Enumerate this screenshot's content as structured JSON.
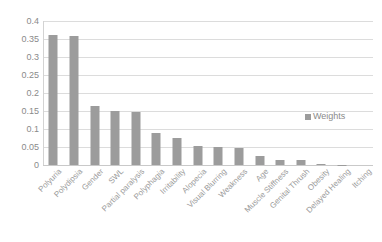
{
  "chart_data": {
    "type": "bar",
    "title": "",
    "subtitle": "",
    "xlabel": "",
    "ylabel": "",
    "ylim": [
      0,
      0.4
    ],
    "ytick_values": [
      0,
      0.05,
      0.1,
      0.15,
      0.2,
      0.25,
      0.3,
      0.35,
      0.4
    ],
    "ytick_labels": [
      "0",
      "0.05",
      "0.1",
      "0.15",
      "0.2",
      "0.25",
      "0.3",
      "0.35",
      "0.4"
    ],
    "grid": true,
    "legend_position": "right-middle",
    "legend": [
      "Weights"
    ],
    "categories": [
      "Polyuria",
      "Polydipsia",
      "Gender",
      "SWL",
      "Partial paralysis",
      "Polyphagia",
      "Irritability",
      "Alopecia",
      "Visual Blurring",
      "Weakness",
      "Age",
      "Muscle Stiffness",
      "Genital Thrush",
      "Obesity",
      "Delayed Healing",
      "Itching"
    ],
    "series": [
      {
        "name": "Weights",
        "color": "#9c9c9c",
        "values": [
          0.361,
          0.358,
          0.163,
          0.151,
          0.146,
          0.09,
          0.074,
          0.053,
          0.049,
          0.046,
          0.024,
          0.015,
          0.013,
          0.004,
          0.001,
          0.0
        ]
      }
    ]
  },
  "colors": {
    "bar": "#9c9c9c",
    "gridline": "#dcdcdc",
    "axis_text": "#8a8a8a",
    "background": "#ffffff"
  }
}
